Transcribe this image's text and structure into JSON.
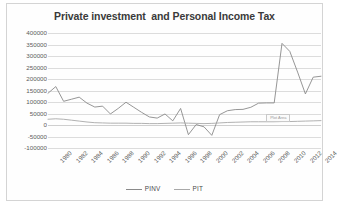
{
  "chart_data": {
    "type": "line",
    "title": "Private investment  and Personal Income Tax",
    "xlabel": "",
    "ylabel": "",
    "ylim": [
      -100000,
      400000
    ],
    "ystep": 50000,
    "xlim": [
      1980,
      2015
    ],
    "grid": true,
    "legend_position": "bottom",
    "y_ticks": [
      "400000",
      "350000",
      "300000",
      "250000",
      "200000",
      "150000",
      "100000",
      "50000",
      "0",
      "-50000",
      "-100000"
    ],
    "x_ticks": [
      "1980",
      "1982",
      "1984",
      "1986",
      "1988",
      "1990",
      "1992",
      "1994",
      "1996",
      "1998",
      "2000",
      "2002",
      "2004",
      "2006",
      "2008",
      "2010",
      "2012",
      "2014"
    ],
    "x": [
      1980,
      1981,
      1982,
      1983,
      1984,
      1985,
      1986,
      1987,
      1988,
      1989,
      1990,
      1991,
      1992,
      1993,
      1994,
      1995,
      1996,
      1997,
      1998,
      1999,
      2000,
      2001,
      2002,
      2003,
      2004,
      2005,
      2006,
      2007,
      2008,
      2009,
      2010,
      2011,
      2012,
      2013,
      2014,
      2015
    ],
    "series": [
      {
        "name": "PINV",
        "color": "#8a8a8a",
        "values": [
          138000,
          167000,
          103000,
          112000,
          121000,
          95000,
          78000,
          82000,
          48000,
          72000,
          99000,
          77000,
          55000,
          35000,
          30000,
          48000,
          18000,
          72000,
          -42000,
          2000,
          -8000,
          -45000,
          45000,
          62000,
          67000,
          68000,
          77000,
          95000,
          96000,
          96000,
          355000,
          320000,
          230000,
          135000,
          208000,
          212000
        ]
      },
      {
        "name": "PIT",
        "color": "#a8a8a8",
        "values": [
          25000,
          27000,
          25000,
          21000,
          17000,
          13000,
          10000,
          9000,
          8000,
          8000,
          8000,
          7000,
          7000,
          6000,
          6000,
          7000,
          8000,
          9000,
          8000,
          7000,
          6000,
          7000,
          9000,
          11000,
          12000,
          13000,
          14000,
          14000,
          14000,
          14000,
          15000,
          15000,
          16000,
          17000,
          18000,
          19000
        ]
      }
    ],
    "annotation": {
      "text": "Plot Area",
      "x": 2009,
      "y": 14000
    }
  },
  "legend": {
    "items": [
      {
        "label": "PINV"
      },
      {
        "label": "PIT"
      }
    ]
  },
  "icons": {
    "line_marker": "line-marker-icon"
  }
}
